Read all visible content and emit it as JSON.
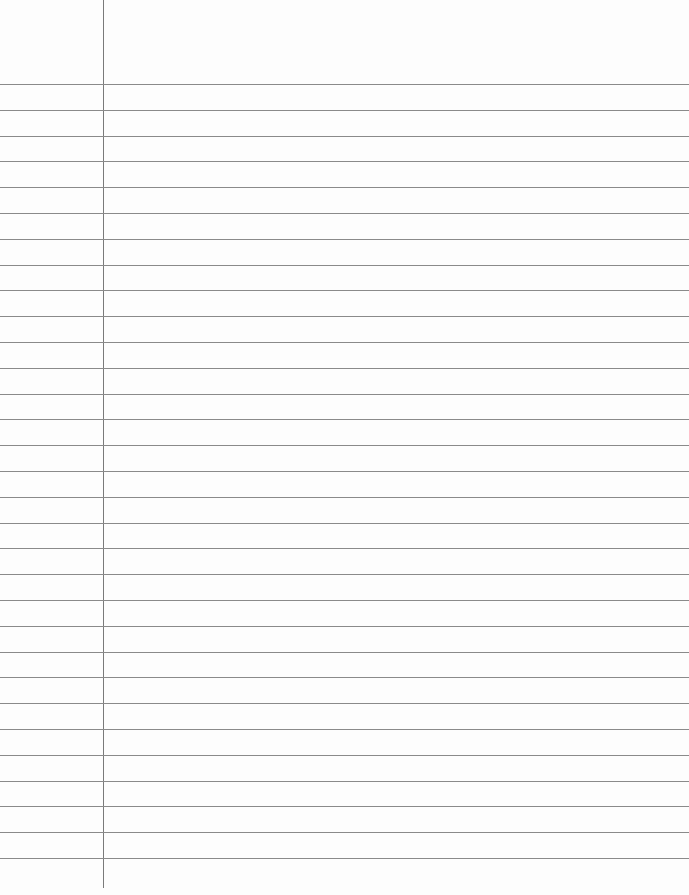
{
  "paper": {
    "type": "lined-paper",
    "background_color": "#fdfdfd",
    "line_color": "#8a8a8a",
    "margin_line_color": "#7a7a7a",
    "margin_x": 103,
    "margin_bottom": 888,
    "first_line_y": 84,
    "line_spacing": 25.8,
    "line_count": 31
  }
}
